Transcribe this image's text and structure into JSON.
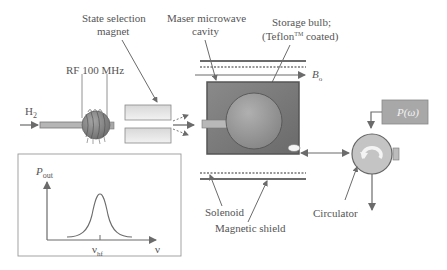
{
  "labels": {
    "state_selection_line1": "State selection",
    "state_selection_line2": "magnet",
    "maser_cavity_line1": "Maser microwave",
    "maser_cavity_line2": "cavity",
    "storage_bulb_line1": "Storage bulb;",
    "storage_bulb_line2_pre": "(Teflon",
    "storage_bulb_tm": "TM",
    "storage_bulb_line2_post": " coated)",
    "rf": "RF 100 MHz",
    "h2": "H",
    "h2_sub": "2",
    "b0": "B",
    "b0_sub": "o",
    "p_omega": "P(ω)",
    "solenoid": "Solenoid",
    "magnetic_shield": "Magnetic shield",
    "circulator": "Circulator"
  },
  "inset_plot": {
    "ylabel": "P",
    "ylabel_sub": "out",
    "xlabel": "ν",
    "tick_label": "ν",
    "tick_label_sub": "hf"
  },
  "colors": {
    "line": "#6b6b6b",
    "cavity_fill": "#7a7a7a",
    "bulb_fill": "#9a9a9a",
    "light_fill": "#cfcfcf",
    "p_box": "#a8a8a8"
  }
}
